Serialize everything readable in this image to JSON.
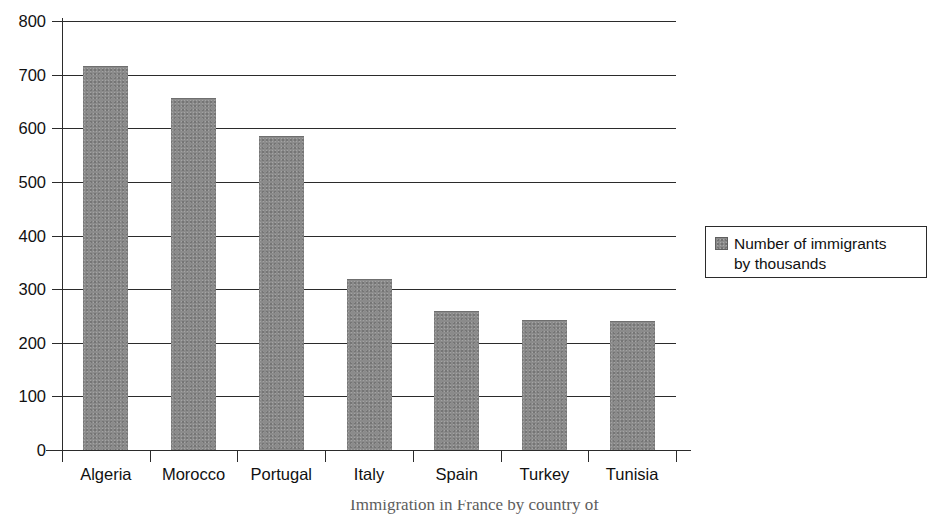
{
  "chart_data": {
    "type": "bar",
    "title": "",
    "categories": [
      "Algeria",
      "Morocco",
      "Portugal",
      "Italy",
      "Spain",
      "Turkey",
      "Tunisia"
    ],
    "values": [
      714,
      655,
      583,
      317,
      258,
      240,
      238
    ],
    "series": [
      {
        "name": "Number of immigrants by thousands",
        "values": [
          714,
          655,
          583,
          317,
          258,
          240,
          238
        ]
      }
    ],
    "xlabel": "",
    "ylabel": "",
    "ylim": [
      0,
      800
    ],
    "ytick_labels": [
      "800",
      "700",
      "600",
      "500",
      "400",
      "300",
      "200",
      "100",
      "0"
    ],
    "ytick_values": [
      800,
      700,
      600,
      500,
      400,
      300,
      200,
      100,
      0
    ],
    "grid": "horizontal",
    "legend_position": "right",
    "legend_entries": [
      "Number of immigrants by thousands"
    ],
    "bar_color": "#8b8b8b",
    "axis_color": "#2b2b2b",
    "background_color": "#ffffff"
  },
  "legend": {
    "line1": "Number of immigrants",
    "line2": "by thousands",
    "swatch_color": "#8b8b8b"
  },
  "caption": {
    "text": "Immigration in France by country of"
  }
}
